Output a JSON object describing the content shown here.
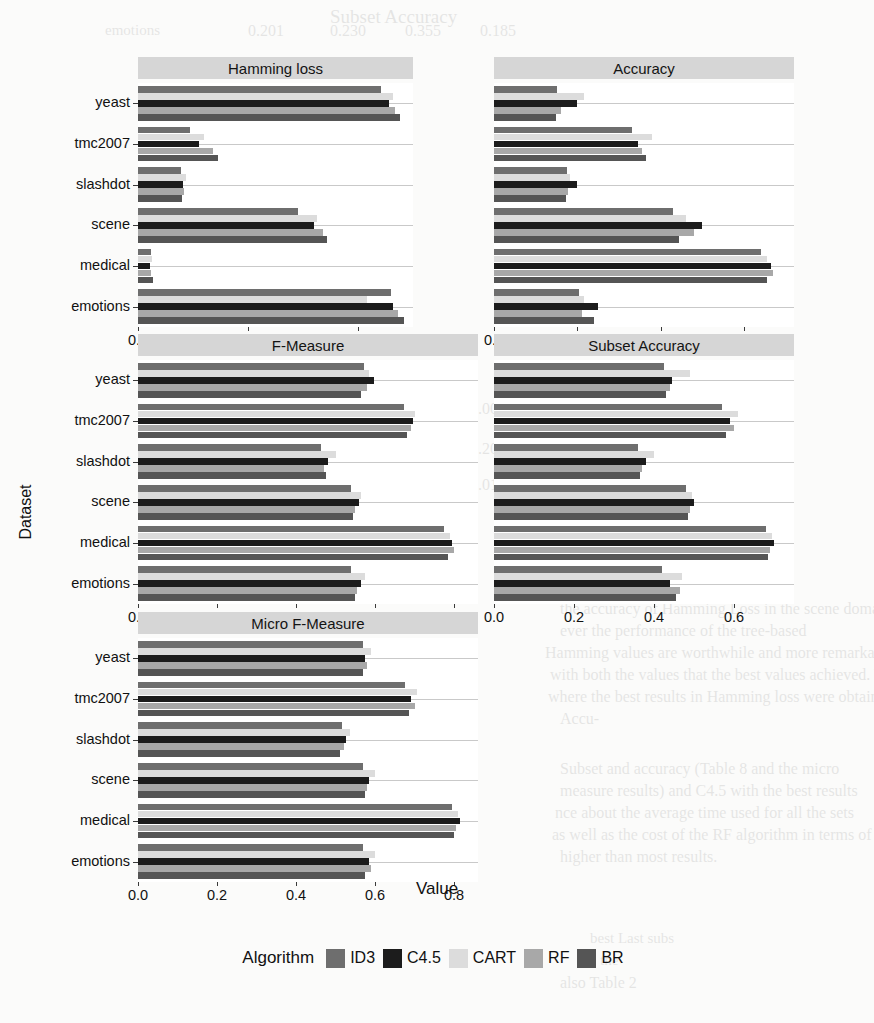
{
  "axes": {
    "ytitle": "Dataset",
    "xtitle": "Value",
    "datasets": [
      "yeast",
      "tmc2007",
      "slashdot",
      "scene",
      "medical",
      "emotions"
    ]
  },
  "legend": {
    "title": "Algorithm",
    "entries": [
      {
        "label": "ID3",
        "color": "#6e6e6e"
      },
      {
        "label": "C4.5",
        "color": "#1c1c1c"
      },
      {
        "label": "CART",
        "color": "#dcdcdc"
      },
      {
        "label": "RF",
        "color": "#a8a8a8"
      },
      {
        "label": "BR",
        "color": "#555555"
      }
    ]
  },
  "chart_data": {
    "type": "bar",
    "title": "",
    "orientation": "horizontal",
    "grid": "y-only",
    "legend_position": "bottom",
    "xlabel": "Value",
    "ylabel": "Dataset",
    "categories": [
      "yeast",
      "tmc2007",
      "slashdot",
      "scene",
      "medical",
      "emotions"
    ],
    "series_names": [
      "ID3",
      "C4.5",
      "CART",
      "RF",
      "BR"
    ],
    "panels": [
      {
        "name": "Hamming loss",
        "xlim": [
          0,
          0.25
        ],
        "xticks": [
          0.0,
          0.1,
          0.2
        ],
        "xticklabels": [
          "0.0",
          "0.1",
          "0.2"
        ],
        "series": [
          {
            "name": "ID3",
            "values": [
              0.221,
              0.047,
              0.039,
              0.145,
              0.012,
              0.23
            ]
          },
          {
            "name": "C4.5",
            "values": [
              0.228,
              0.055,
              0.041,
              0.16,
              0.011,
              0.232
            ]
          },
          {
            "name": "CART",
            "values": [
              0.232,
              0.06,
              0.044,
              0.163,
              0.013,
              0.208
            ]
          },
          {
            "name": "RF",
            "values": [
              0.234,
              0.068,
              0.042,
              0.168,
              0.012,
              0.236
            ]
          },
          {
            "name": "BR",
            "values": [
              0.238,
              0.073,
              0.04,
              0.172,
              0.014,
              0.242
            ]
          }
        ]
      },
      {
        "name": "Accuracy",
        "xlim": [
          0,
          0.72
        ],
        "xticks": [
          0.0,
          0.2,
          0.4,
          0.6
        ],
        "xticklabels": [
          "0.0",
          "0.2",
          "0.4",
          "0.6"
        ],
        "series": [
          {
            "name": "ID3",
            "values": [
              0.15,
              0.33,
              0.175,
              0.43,
              0.64,
              0.205
            ]
          },
          {
            "name": "C4.5",
            "values": [
              0.2,
              0.345,
              0.2,
              0.5,
              0.665,
              0.25
            ]
          },
          {
            "name": "CART",
            "values": [
              0.215,
              0.38,
              0.182,
              0.46,
              0.655,
              0.215
            ]
          },
          {
            "name": "RF",
            "values": [
              0.16,
              0.355,
              0.178,
              0.48,
              0.67,
              0.21
            ]
          },
          {
            "name": "BR",
            "values": [
              0.148,
              0.365,
              0.172,
              0.445,
              0.655,
              0.24
            ]
          }
        ]
      },
      {
        "name": "F-Measure",
        "xlim": [
          0,
          0.86
        ],
        "xticks": [
          0.0,
          0.2,
          0.4,
          0.6,
          0.8
        ],
        "xticklabels": [
          "0.0",
          "0.2",
          "0.4",
          "0.6",
          "0.8"
        ],
        "series": [
          {
            "name": "ID3",
            "values": [
              0.572,
              0.672,
              0.462,
              0.54,
              0.775,
              0.54
            ]
          },
          {
            "name": "C4.5",
            "values": [
              0.596,
              0.695,
              0.48,
              0.56,
              0.795,
              0.565
            ]
          },
          {
            "name": "CART",
            "values": [
              0.585,
              0.7,
              0.5,
              0.565,
              0.79,
              0.575
            ]
          },
          {
            "name": "RF",
            "values": [
              0.58,
              0.69,
              0.47,
              0.55,
              0.8,
              0.555
            ]
          },
          {
            "name": "BR",
            "values": [
              0.565,
              0.68,
              0.475,
              0.545,
              0.785,
              0.55
            ]
          }
        ]
      },
      {
        "name": "Subset Accuracy",
        "xlim": [
          0,
          0.75
        ],
        "xticks": [
          0.0,
          0.2,
          0.4,
          0.6
        ],
        "xticklabels": [
          "0.0",
          "0.2",
          "0.4",
          "0.6"
        ],
        "series": [
          {
            "name": "ID3",
            "values": [
              0.425,
              0.57,
              0.36,
              0.48,
              0.68,
              0.42
            ]
          },
          {
            "name": "C4.5",
            "values": [
              0.445,
              0.59,
              0.38,
              0.5,
              0.7,
              0.44
            ]
          },
          {
            "name": "CART",
            "values": [
              0.49,
              0.61,
              0.4,
              0.495,
              0.695,
              0.47
            ]
          },
          {
            "name": "RF",
            "values": [
              0.44,
              0.6,
              0.37,
              0.49,
              0.69,
              0.465
            ]
          },
          {
            "name": "BR",
            "values": [
              0.43,
              0.58,
              0.365,
              0.485,
              0.685,
              0.455
            ]
          }
        ]
      },
      {
        "name": "Micro F-Measure",
        "xlim": [
          0,
          0.86
        ],
        "xticks": [
          0.0,
          0.2,
          0.4,
          0.6,
          0.8
        ],
        "xticklabels": [
          "0.0",
          "0.2",
          "0.4",
          "0.6",
          "0.8"
        ],
        "series": [
          {
            "name": "ID3",
            "values": [
              0.57,
              0.675,
              0.515,
              0.57,
              0.795,
              0.57
            ]
          },
          {
            "name": "C4.5",
            "values": [
              0.575,
              0.69,
              0.525,
              0.585,
              0.815,
              0.585
            ]
          },
          {
            "name": "CART",
            "values": [
              0.59,
              0.705,
              0.535,
              0.6,
              0.81,
              0.6
            ]
          },
          {
            "name": "RF",
            "values": [
              0.58,
              0.7,
              0.52,
              0.58,
              0.805,
              0.59
            ]
          },
          {
            "name": "BR",
            "values": [
              0.568,
              0.685,
              0.51,
              0.575,
              0.8,
              0.575
            ]
          }
        ]
      }
    ]
  },
  "ghost_text": [
    {
      "t": "Subset Accuracy",
      "x": 330,
      "y": 6,
      "s": 19
    },
    {
      "t": "emotions",
      "x": 105,
      "y": 22,
      "s": 15
    },
    {
      "t": "0.201",
      "x": 248,
      "y": 22,
      "s": 16
    },
    {
      "t": "0.230",
      "x": 330,
      "y": 22,
      "s": 16
    },
    {
      "t": "0.355",
      "x": 405,
      "y": 22,
      "s": 16
    },
    {
      "t": "0.185",
      "x": 480,
      "y": 22,
      "s": 16
    },
    {
      "t": "0.05",
      "x": 250,
      "y": 120,
      "s": 16
    },
    {
      "t": "0.05",
      "x": 330,
      "y": 120,
      "s": 16
    },
    {
      "t": "0.344",
      "x": 250,
      "y": 145,
      "s": 17
    },
    {
      "t": "0.352",
      "x": 330,
      "y": 145,
      "s": 17
    },
    {
      "t": "tolerance",
      "x": 240,
      "y": 170,
      "s": 17
    },
    {
      "t": "0.568",
      "x": 250,
      "y": 196,
      "s": 17
    },
    {
      "t": "4.43",
      "x": 255,
      "y": 222,
      "s": 17
    },
    {
      "t": "76.5",
      "x": 200,
      "y": 222,
      "s": 17
    },
    {
      "t": "medical",
      "x": 210,
      "y": 250,
      "s": 15
    },
    {
      "t": "0.014",
      "x": 250,
      "y": 292,
      "s": 17
    },
    {
      "t": "0.890",
      "x": 330,
      "y": 292,
      "s": 17
    },
    {
      "t": "0.001",
      "x": 470,
      "y": 400,
      "s": 16
    },
    {
      "t": "0.200",
      "x": 470,
      "y": 440,
      "s": 16
    },
    {
      "t": "0.016",
      "x": 470,
      "y": 476,
      "s": 16
    },
    {
      "t": "the accuracy of Hamming Loss in the scene domain. In",
      "x": 560,
      "y": 600,
      "s": 16
    },
    {
      "t": "ever the performance of the tree-based",
      "x": 560,
      "y": 622,
      "s": 16
    },
    {
      "t": "Hamming values are worthwhile and more remarkable given",
      "x": 545,
      "y": 644,
      "s": 16
    },
    {
      "t": "with both the values that the best values achieved. We show in",
      "x": 550,
      "y": 666,
      "s": 16
    },
    {
      "t": "where the best results in Hamming loss were obtained with",
      "x": 548,
      "y": 688,
      "s": 16
    },
    {
      "t": "Accu-",
      "x": 560,
      "y": 710,
      "s": 16
    },
    {
      "t": "Subset and accuracy (Table 8 and the micro",
      "x": 560,
      "y": 760,
      "s": 16
    },
    {
      "t": "measure results) and C4.5 with the best results",
      "x": 560,
      "y": 782,
      "s": 16
    },
    {
      "t": "nce about the average time used for all the sets",
      "x": 555,
      "y": 804,
      "s": 16
    },
    {
      "t": "as well as the cost of the RF algorithm in terms of time in",
      "x": 552,
      "y": 826,
      "s": 16
    },
    {
      "t": "higher than most results.",
      "x": 560,
      "y": 848,
      "s": 16
    },
    {
      "t": "best  Last  subs",
      "x": 590,
      "y": 930,
      "s": 15
    },
    {
      "t": "the",
      "x": 600,
      "y": 952,
      "s": 15
    },
    {
      "t": "also Table 2",
      "x": 560,
      "y": 974,
      "s": 16
    }
  ]
}
